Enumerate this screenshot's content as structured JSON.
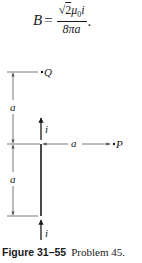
{
  "formula": {
    "lhs": "B",
    "equals": "=",
    "numerator_sqrt": "√",
    "numerator_radicand": "2",
    "numerator_mu": "μ",
    "numerator_mu_sub": "0",
    "numerator_current": "i",
    "denominator": "8πa",
    "terminator": "."
  },
  "diagram": {
    "point_Q": "Q",
    "point_P": "P",
    "dimension_upper": "a",
    "dimension_lower": "a",
    "dimension_horizontal": "a",
    "current_upper": "i",
    "current_lower": "i",
    "colors": {
      "line": "#1a1a1a",
      "dimension_line": "#555555"
    }
  },
  "caption": {
    "figure_label": "Figure 31–55",
    "problem_label": "Problem 45."
  }
}
